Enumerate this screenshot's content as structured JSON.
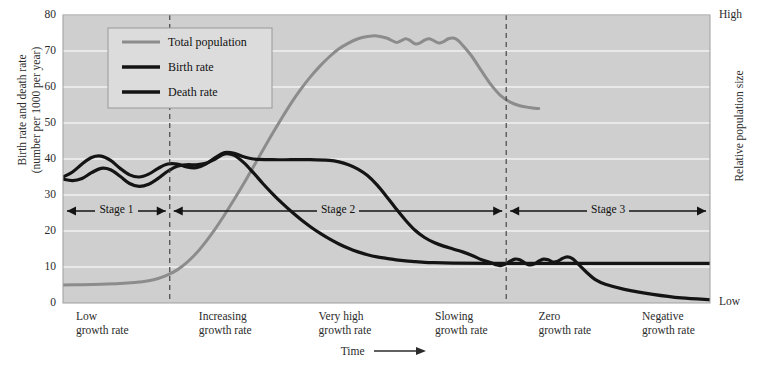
{
  "chart_data": {
    "type": "line",
    "title": "",
    "xlabel": "Time",
    "ylabel": "Birth rate and death rate (number per 1000 per year)",
    "ylabel_line1": "Birth rate and death rate",
    "ylabel_line2": "(number per 1000 per year)",
    "right_axis_label": "Relative population size",
    "right_axis_high": "High",
    "right_axis_low": "Low",
    "ylim": [
      0,
      80
    ],
    "yticks": [
      0,
      10,
      20,
      30,
      40,
      50,
      60,
      70,
      80
    ],
    "grid": true,
    "legend_position": "top-left",
    "xlim": [
      0,
      100
    ],
    "series": [
      {
        "name": "Total population",
        "color": "#8c8c8c",
        "axis": "right",
        "points": [
          [
            0,
            5.0
          ],
          [
            4,
            5.1
          ],
          [
            8,
            5.2
          ],
          [
            12,
            5.4
          ],
          [
            15,
            5.7
          ],
          [
            18,
            6.2
          ],
          [
            20,
            6.8
          ],
          [
            22,
            7.8
          ],
          [
            24,
            9.2
          ],
          [
            26,
            11.2
          ],
          [
            28,
            13.8
          ],
          [
            30,
            17.0
          ],
          [
            32,
            20.6
          ],
          [
            34,
            24.6
          ],
          [
            36,
            28.8
          ],
          [
            38,
            33.2
          ],
          [
            40,
            37.8
          ],
          [
            42,
            42.4
          ],
          [
            44,
            47.0
          ],
          [
            46,
            51.4
          ],
          [
            48,
            55.6
          ],
          [
            50,
            59.4
          ],
          [
            52,
            62.8
          ],
          [
            54,
            65.8
          ],
          [
            56,
            68.4
          ],
          [
            58,
            70.6
          ],
          [
            60,
            72.2
          ],
          [
            62,
            73.4
          ],
          [
            64,
            74.0
          ],
          [
            66,
            74.2
          ],
          [
            68,
            73.6
          ],
          [
            70,
            72.4
          ],
          [
            71,
            72.8
          ],
          [
            72,
            73.4
          ],
          [
            73,
            72.9
          ],
          [
            74,
            72.0
          ],
          [
            75,
            72.2
          ],
          [
            76,
            73.0
          ],
          [
            77,
            73.4
          ],
          [
            78,
            72.8
          ],
          [
            79,
            72.2
          ],
          [
            80,
            72.6
          ],
          [
            81,
            73.4
          ],
          [
            82,
            73.6
          ],
          [
            83,
            73.0
          ],
          [
            84,
            71.6
          ],
          [
            86,
            68.4
          ],
          [
            88,
            64.4
          ],
          [
            90,
            60.6
          ],
          [
            92,
            57.6
          ],
          [
            94,
            55.8
          ],
          [
            96,
            54.8
          ],
          [
            98,
            54.3
          ],
          [
            100,
            54.0
          ]
        ]
      },
      {
        "name": "Birth rate",
        "color": "#141414",
        "axis": "left",
        "points": [
          [
            0,
            35.0
          ],
          [
            2,
            36.4
          ],
          [
            4,
            38.6
          ],
          [
            6,
            40.4
          ],
          [
            8,
            40.8
          ],
          [
            10,
            39.6
          ],
          [
            12,
            37.4
          ],
          [
            14,
            35.6
          ],
          [
            16,
            35.0
          ],
          [
            18,
            35.8
          ],
          [
            20,
            37.4
          ],
          [
            22,
            38.6
          ],
          [
            24,
            38.6
          ],
          [
            26,
            37.8
          ],
          [
            28,
            37.6
          ],
          [
            30,
            38.6
          ],
          [
            32,
            40.4
          ],
          [
            34,
            41.8
          ],
          [
            36,
            41.6
          ],
          [
            38,
            40.6
          ],
          [
            40,
            40.0
          ],
          [
            44,
            39.8
          ],
          [
            48,
            39.8
          ],
          [
            52,
            39.8
          ],
          [
            56,
            39.6
          ],
          [
            58,
            39.2
          ],
          [
            60,
            38.4
          ],
          [
            62,
            37.2
          ],
          [
            64,
            35.4
          ],
          [
            66,
            32.8
          ],
          [
            68,
            29.6
          ],
          [
            70,
            26.2
          ],
          [
            72,
            23.0
          ],
          [
            74,
            20.2
          ],
          [
            76,
            18.2
          ],
          [
            78,
            16.8
          ],
          [
            80,
            15.8
          ],
          [
            82,
            15.0
          ],
          [
            84,
            14.2
          ],
          [
            86,
            13.2
          ],
          [
            88,
            12.0
          ],
          [
            90,
            11.2
          ],
          [
            91,
            10.6
          ],
          [
            92,
            10.4
          ],
          [
            93,
            10.8
          ],
          [
            94,
            11.6
          ],
          [
            95,
            12.2
          ],
          [
            96,
            12.0
          ],
          [
            97,
            11.2
          ],
          [
            98,
            10.6
          ],
          [
            99,
            10.8
          ],
          [
            100,
            11.6
          ],
          [
            101,
            12.2
          ],
          [
            102,
            12.0
          ],
          [
            103,
            11.4
          ],
          [
            104,
            11.6
          ],
          [
            105,
            12.4
          ],
          [
            106,
            12.8
          ],
          [
            107,
            12.4
          ],
          [
            108,
            11.2
          ],
          [
            110,
            8.6
          ],
          [
            112,
            6.4
          ],
          [
            114,
            5.2
          ],
          [
            118,
            3.8
          ],
          [
            124,
            2.4
          ],
          [
            130,
            1.4
          ],
          [
            136,
            0.9
          ]
        ]
      },
      {
        "name": "Death rate",
        "color": "#141414",
        "axis": "left",
        "points": [
          [
            0,
            34.4
          ],
          [
            2,
            34.0
          ],
          [
            4,
            34.6
          ],
          [
            6,
            36.2
          ],
          [
            8,
            37.4
          ],
          [
            10,
            37.0
          ],
          [
            12,
            35.2
          ],
          [
            14,
            33.2
          ],
          [
            16,
            32.4
          ],
          [
            18,
            33.0
          ],
          [
            20,
            34.6
          ],
          [
            22,
            36.6
          ],
          [
            24,
            38.0
          ],
          [
            26,
            38.4
          ],
          [
            28,
            38.4
          ],
          [
            30,
            38.8
          ],
          [
            32,
            40.0
          ],
          [
            34,
            41.4
          ],
          [
            36,
            41.0
          ],
          [
            38,
            39.0
          ],
          [
            40,
            36.2
          ],
          [
            42,
            33.2
          ],
          [
            44,
            30.4
          ],
          [
            46,
            27.8
          ],
          [
            48,
            25.4
          ],
          [
            50,
            23.2
          ],
          [
            52,
            21.2
          ],
          [
            54,
            19.4
          ],
          [
            56,
            17.8
          ],
          [
            58,
            16.4
          ],
          [
            60,
            15.2
          ],
          [
            62,
            14.2
          ],
          [
            64,
            13.4
          ],
          [
            66,
            12.8
          ],
          [
            68,
            12.4
          ],
          [
            70,
            12.0
          ],
          [
            72,
            11.7
          ],
          [
            74,
            11.5
          ],
          [
            76,
            11.3
          ],
          [
            78,
            11.2
          ],
          [
            82,
            11.1
          ],
          [
            90,
            11.0
          ],
          [
            100,
            11.0
          ],
          [
            110,
            11.0
          ],
          [
            120,
            11.0
          ],
          [
            130,
            11.0
          ],
          [
            136,
            11.0
          ]
        ]
      }
    ],
    "stages": [
      {
        "label": "Stage 1",
        "start_pct": 0.0,
        "end_pct": 16.5
      },
      {
        "label": "Stage 2",
        "start_pct": 16.5,
        "end_pct": 68.5
      },
      {
        "label": "Stage 3",
        "start_pct": 68.5,
        "end_pct": 100.0
      }
    ],
    "dividers_pct": [
      16.5,
      68.5
    ],
    "x_categories": [
      {
        "line1": "Low",
        "line2": "growth rate",
        "pos_pct": 2.0
      },
      {
        "line1": "Increasing",
        "line2": "growth rate",
        "pos_pct": 21.0
      },
      {
        "line1": "Very high",
        "line2": "growth rate",
        "pos_pct": 39.5
      },
      {
        "line1": "Slowing",
        "line2": "growth rate",
        "pos_pct": 57.5
      },
      {
        "line1": "Zero",
        "line2": "growth rate",
        "pos_pct": 73.5
      },
      {
        "line1": "Negative",
        "line2": "growth rate",
        "pos_pct": 89.5
      }
    ],
    "colors": {
      "plot_background": "#cfcfcf",
      "gridline": "#f2f2f2",
      "population": "#8c8c8c",
      "rate": "#141414",
      "legend_background": "#dcdcdc",
      "legend_border": "#9a9a9a",
      "text": "#2b2b2b"
    }
  }
}
